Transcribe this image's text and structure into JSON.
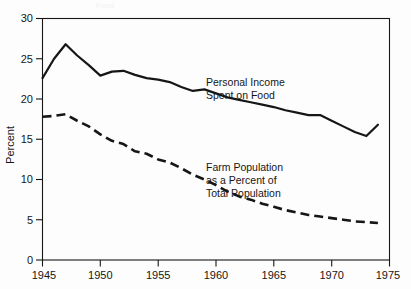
{
  "figure": {
    "background_color": "#fdfdfd",
    "ink_color": "#161616",
    "cropped_title_fragment": "Food"
  },
  "chart_data": {
    "type": "line",
    "title": "",
    "xlabel": "",
    "ylabel": "Percent",
    "xlim": [
      1945,
      1975
    ],
    "ylim": [
      0,
      30
    ],
    "xticks": [
      1945,
      1950,
      1955,
      1960,
      1965,
      1970,
      1975
    ],
    "xticklabels": [
      "1945",
      "1950",
      "1955",
      "1960",
      "1965",
      "1970",
      "1975"
    ],
    "yticks": [
      0,
      5,
      10,
      15,
      20,
      25,
      30
    ],
    "yticklabels": [
      "0",
      "5",
      "10",
      "15",
      "20",
      "25",
      "30"
    ],
    "grid": false,
    "legend": "none",
    "annotations": [
      {
        "name": "personal-income-label",
        "lines": [
          "Personal Income",
          "Spent on Food"
        ],
        "x": 1960.2,
        "y": 21.7
      },
      {
        "name": "farm-population-label",
        "lines": [
          "Farm Population",
          "as a Percent of",
          "Total Population"
        ],
        "x": 1960.0,
        "y": 12.6
      }
    ],
    "series": [
      {
        "name": "Personal Income Spent on Food",
        "style": "solid",
        "linewidth": 2.2,
        "color": "#161616",
        "x": [
          1945,
          1946,
          1947,
          1948,
          1949,
          1950,
          1951,
          1952,
          1953,
          1954,
          1955,
          1956,
          1957,
          1958,
          1959,
          1960,
          1961,
          1962,
          1963,
          1964,
          1965,
          1966,
          1967,
          1968,
          1969,
          1970,
          1971,
          1972,
          1973,
          1974
        ],
        "values": [
          22.6,
          25.0,
          26.8,
          25.4,
          24.2,
          22.9,
          23.4,
          23.5,
          23.0,
          22.6,
          22.4,
          22.1,
          21.5,
          21.0,
          21.2,
          20.7,
          20.2,
          19.9,
          19.6,
          19.3,
          19.0,
          18.6,
          18.3,
          18.0,
          18.0,
          17.3,
          16.6,
          15.9,
          15.4,
          16.8
        ]
      },
      {
        "name": "Farm Population as a Percent of Total Population",
        "style": "dashed",
        "linewidth": 2.6,
        "dash_pattern": "9,5",
        "color": "#161616",
        "x": [
          1945,
          1946,
          1947,
          1948,
          1949,
          1950,
          1951,
          1952,
          1953,
          1954,
          1955,
          1956,
          1957,
          1958,
          1959,
          1960,
          1961,
          1962,
          1963,
          1964,
          1965,
          1966,
          1967,
          1968,
          1969,
          1970,
          1971,
          1972,
          1973,
          1974
        ],
        "values": [
          17.8,
          17.9,
          18.1,
          17.3,
          16.6,
          15.6,
          14.8,
          14.4,
          13.5,
          13.2,
          12.5,
          12.1,
          11.4,
          10.6,
          10.0,
          9.3,
          8.5,
          7.9,
          7.5,
          7.0,
          6.6,
          6.2,
          5.9,
          5.6,
          5.4,
          5.2,
          5.0,
          4.8,
          4.7,
          4.6
        ]
      }
    ]
  }
}
